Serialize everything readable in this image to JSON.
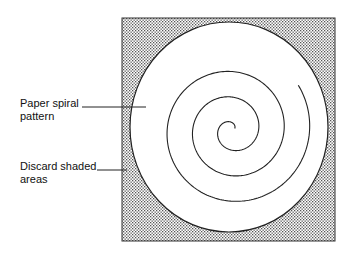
{
  "diagram": {
    "labels": {
      "paper_spiral": "Paper spiral\npattern",
      "paper_spiral_line1": "Paper spiral",
      "paper_spiral_line2": "pattern",
      "discard_line1": "Discard shaded",
      "discard_line2": "areas"
    },
    "square": {
      "x": 122,
      "y": 18,
      "width": 213,
      "height": 223
    },
    "outer_circle": {
      "cx": 229,
      "cy": 127,
      "rx": 99,
      "ry": 105
    },
    "spiral": {
      "cx": 232,
      "cy": 130,
      "spacing": 25.5,
      "max_radius": 80,
      "start_radius": 3
    },
    "colors": {
      "stroke": "#222222",
      "shade_dot": "#555555",
      "background": "#ffffff"
    }
  }
}
